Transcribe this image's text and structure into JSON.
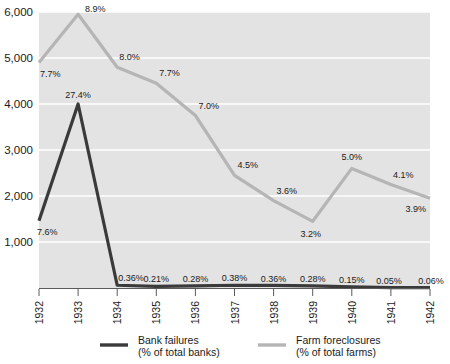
{
  "chart_data": {
    "type": "line",
    "title": "",
    "subtitle": "",
    "xlabel": "",
    "ylabel": "",
    "x": [
      "1932",
      "1933",
      "1934",
      "1935",
      "1936",
      "1937",
      "1938",
      "1939",
      "1940",
      "1941",
      "1942"
    ],
    "ylim": [
      0,
      6000
    ],
    "yticks": [
      1000,
      2000,
      3000,
      4000,
      5000,
      6000
    ],
    "ytick_labels": [
      "1,000",
      "2,000",
      "3,000",
      "4,000",
      "5,000",
      "6,000"
    ],
    "grid": "horizontal",
    "legend_position": "bottom",
    "series": [
      {
        "name": "Bank failures",
        "unit": "(% of total banks)",
        "color": "#3a3a3a",
        "values": [
          1460,
          4000,
          60,
          35,
          45,
          60,
          55,
          45,
          25,
          10,
          10
        ],
        "point_labels": [
          "7.6%",
          "27.4%",
          "0.36%",
          "0.21%",
          "0.28%",
          "0.38%",
          "0.36%",
          "0.28%",
          "0.15%",
          "0.05%",
          "0.06%"
        ]
      },
      {
        "name": "Farm foreclosures",
        "unit": "(% of total farms)",
        "color": "#b5b5b5",
        "values": [
          4900,
          5950,
          4800,
          4450,
          3750,
          2450,
          1900,
          1450,
          2600,
          2250,
          1950
        ],
        "point_labels": [
          "7.7%",
          "8.9%",
          "8.0%",
          "7.7%",
          "7.0%",
          "4.5%",
          "3.6%",
          "3.2%",
          "5.0%",
          "4.1%",
          "3.9%"
        ]
      }
    ]
  },
  "legend": {
    "items": [
      {
        "name": "Bank failures",
        "unit": "(% of total banks)",
        "color": "#3a3a3a"
      },
      {
        "name": "Farm foreclosures",
        "unit": "(% of total farms)",
        "color": "#b5b5b5"
      }
    ]
  },
  "colors": {
    "plot_background": "#e3e3e3",
    "gridline": "#ffffff",
    "axis": "#5a5a5a",
    "text": "#1a1a1a",
    "bank_failures": "#3a3a3a",
    "farm_foreclosures": "#b5b5b5"
  }
}
